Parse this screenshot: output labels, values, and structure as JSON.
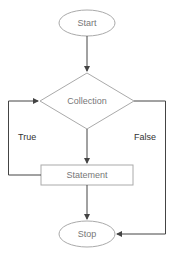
{
  "diagram": {
    "type": "flowchart",
    "colors": {
      "shape_stroke": "#aaaaaa",
      "connector": "#444444",
      "node_text": "#777777",
      "label_text": "#333333"
    },
    "nodes": {
      "start": {
        "shape": "ellipse",
        "label": "Start"
      },
      "collection": {
        "shape": "diamond",
        "label": "Collection"
      },
      "statement": {
        "shape": "rectangle",
        "label": "Statement"
      },
      "stop": {
        "shape": "ellipse",
        "label": "Stop"
      }
    },
    "edges": [
      {
        "from": "start",
        "to": "collection",
        "label": ""
      },
      {
        "from": "collection",
        "to": "statement",
        "label": ""
      },
      {
        "from": "statement",
        "to": "collection",
        "label": "True"
      },
      {
        "from": "collection",
        "to": "stop",
        "label": "False"
      },
      {
        "from": "statement",
        "to": "stop",
        "label": ""
      }
    ],
    "edge_labels": {
      "true": "True",
      "false": "False"
    }
  }
}
